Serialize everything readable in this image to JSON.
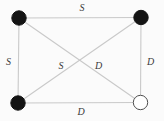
{
  "diagram": {
    "type": "graph",
    "background": "#fbfbfb",
    "colors": {
      "edge": "#c9c9c9",
      "label": "#3a3a3a",
      "node_filled": "#141414",
      "node_open_fill": "#ffffff",
      "node_open_stroke": "#4f4f4f"
    },
    "nodes": [
      {
        "id": "top-left",
        "filled": true,
        "fill": "#141414",
        "stroke": "#141414"
      },
      {
        "id": "top-right",
        "filled": true,
        "fill": "#141414",
        "stroke": "#141414"
      },
      {
        "id": "bottom-left",
        "filled": true,
        "fill": "#141414",
        "stroke": "#141414"
      },
      {
        "id": "bottom-right",
        "filled": false,
        "fill": "#ffffff",
        "stroke": "#4f4f4f"
      }
    ],
    "edges": [
      {
        "from": "top-left",
        "to": "top-right",
        "label": "S"
      },
      {
        "from": "top-left",
        "to": "bottom-left",
        "label": "S"
      },
      {
        "from": "bottom-left",
        "to": "top-right",
        "label": "S"
      },
      {
        "from": "top-left",
        "to": "bottom-right",
        "label": "D"
      },
      {
        "from": "top-right",
        "to": "bottom-right",
        "label": "D"
      },
      {
        "from": "bottom-left",
        "to": "bottom-right",
        "label": "D"
      }
    ]
  }
}
